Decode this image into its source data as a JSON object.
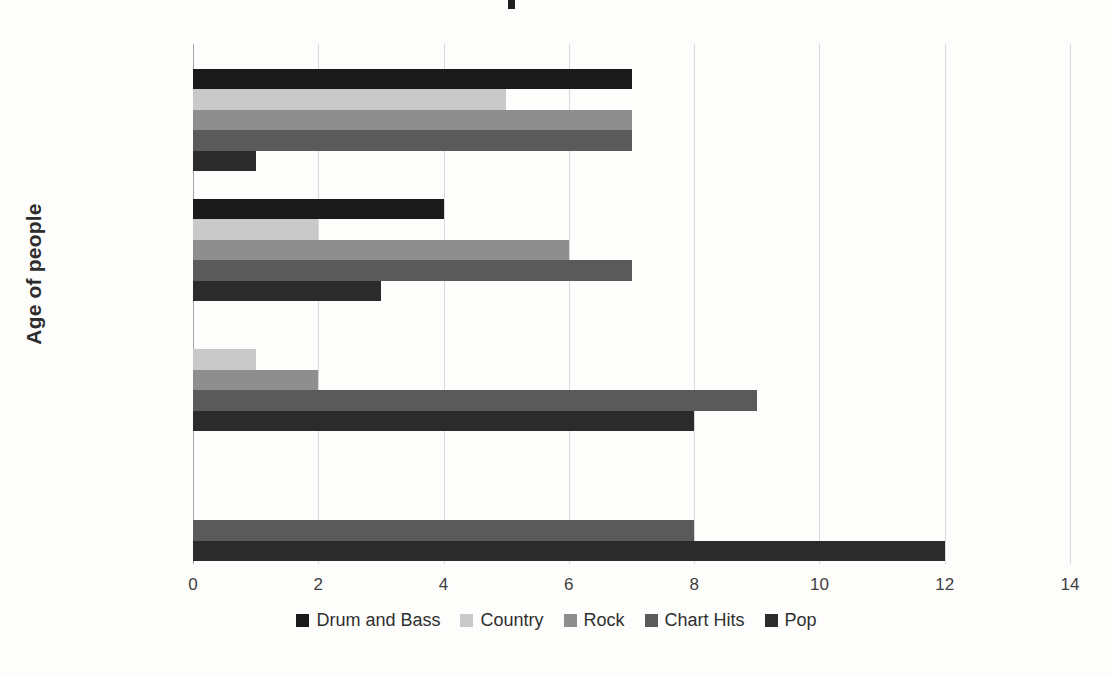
{
  "chart_data": {
    "type": "bar",
    "orientation": "horizontal",
    "title": "",
    "xlabel": "",
    "ylabel": "Age of people",
    "categories": [
      "age 10-13",
      "age 14-16",
      "age 17-19",
      "age 21+"
    ],
    "series": [
      {
        "name": "Drum and Bass",
        "color": "#1a1a1a",
        "values": [
          0,
          0,
          4,
          7
        ]
      },
      {
        "name": "Country",
        "color": "#c9c9c9",
        "values": [
          0,
          1,
          2,
          5
        ]
      },
      {
        "name": "Rock",
        "color": "#8e8e8e",
        "values": [
          0,
          2,
          6,
          7
        ]
      },
      {
        "name": "Chart Hits",
        "color": "#5a5a5a",
        "values": [
          8,
          9,
          7,
          7
        ]
      },
      {
        "name": "Pop",
        "color": "#2b2b2b",
        "values": [
          12,
          8,
          3,
          1
        ]
      }
    ],
    "xlim": [
      0,
      14
    ],
    "xticks": [
      "0",
      "2",
      "4",
      "6",
      "8",
      "10",
      "12",
      "14"
    ],
    "xtick_values": [
      0,
      2,
      4,
      6,
      8,
      10,
      12,
      14
    ],
    "grid": "vertical",
    "legend_position": "bottom"
  },
  "axis": {
    "y_title": "Age of people"
  },
  "legend": {
    "entries": [
      {
        "label": "Drum and Bass",
        "color": "#1a1a1a"
      },
      {
        "label": "Country",
        "color": "#c9c9c9"
      },
      {
        "label": "Rock",
        "color": "#8e8e8e"
      },
      {
        "label": "Chart Hits",
        "color": "#5a5a5a"
      },
      {
        "label": "Pop",
        "color": "#2b2b2b"
      }
    ]
  }
}
